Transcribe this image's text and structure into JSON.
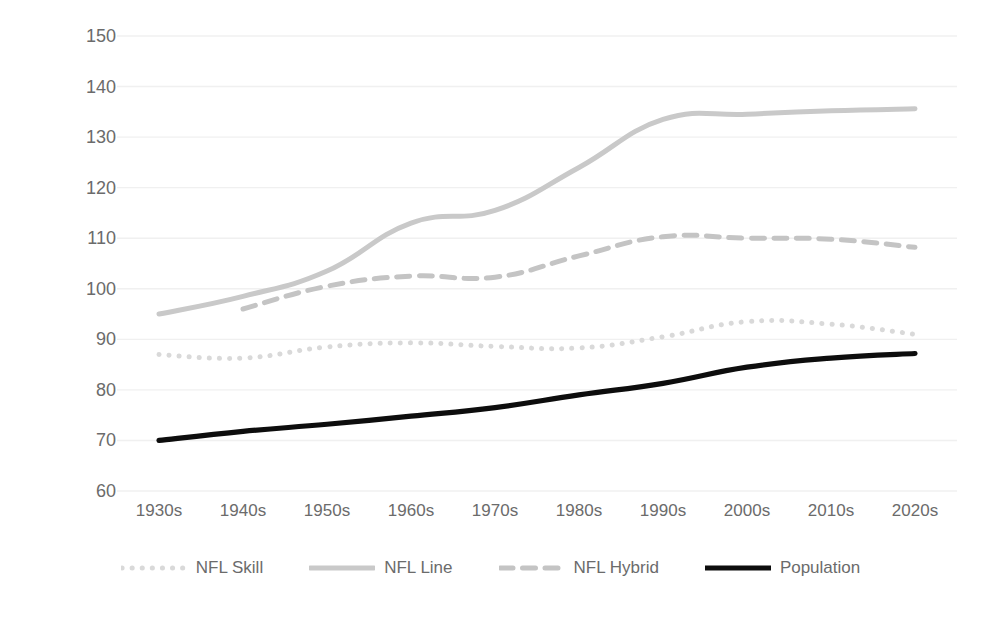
{
  "chart_data": {
    "type": "line",
    "title": "",
    "xlabel": "",
    "ylabel": "Average Player Weight (kg)",
    "categories": [
      "1930s",
      "1940s",
      "1950s",
      "1960s",
      "1970s",
      "1980s",
      "1990s",
      "2000s",
      "2010s",
      "2020s"
    ],
    "ylim": [
      60,
      150
    ],
    "ytick_step": 10,
    "yticks": [
      60,
      70,
      80,
      90,
      100,
      110,
      120,
      130,
      140,
      150
    ],
    "grid": true,
    "legend_position": "bottom",
    "series": [
      {
        "name": "NFL Skill",
        "style": "dotted",
        "color": "#d9d9d9",
        "values": [
          87.0,
          86.3,
          88.5,
          89.3,
          88.6,
          88.3,
          90.5,
          93.5,
          93.0,
          91.0
        ]
      },
      {
        "name": "NFL Line",
        "style": "solid",
        "color": "#c9c9c9",
        "values": [
          95.0,
          98.5,
          103.5,
          113.0,
          115.5,
          124.0,
          133.5,
          134.5,
          135.2,
          135.6
        ]
      },
      {
        "name": "NFL Hybrid",
        "style": "dashed",
        "color": "#c4c4c4",
        "values": [
          null,
          96.0,
          100.5,
          102.5,
          102.3,
          106.5,
          110.3,
          110.0,
          109.8,
          108.2
        ]
      },
      {
        "name": "Population",
        "style": "solid",
        "color": "#0d0d0d",
        "values": [
          70.0,
          71.8,
          73.2,
          74.8,
          76.5,
          79.0,
          81.3,
          84.5,
          86.3,
          87.2
        ]
      }
    ]
  },
  "axes": {
    "y_title": "Average Player Weight (kg)"
  },
  "legend": {
    "items": [
      {
        "label": "NFL Skill"
      },
      {
        "label": "NFL Line"
      },
      {
        "label": "NFL Hybrid"
      },
      {
        "label": "Population"
      }
    ]
  }
}
